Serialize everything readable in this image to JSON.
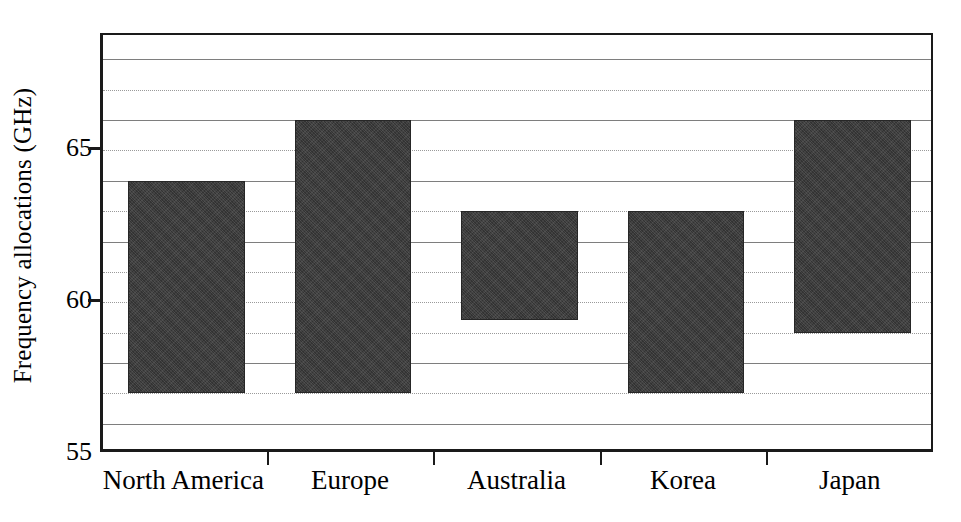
{
  "chart_data": {
    "type": "bar",
    "title": "",
    "subtitle": "",
    "xlabel": "",
    "ylabel": "Frequency allocations (GHz)",
    "categories": [
      "North America",
      "Europe",
      "Australia",
      "Korea",
      "Japan"
    ],
    "bar_style": "floating range bars (band start to band end)",
    "series": [
      {
        "name": "Frequency allocation band",
        "bands": [
          {
            "category": "North America",
            "low": 57.0,
            "high": 64.0
          },
          {
            "category": "Europe",
            "low": 57.0,
            "high": 66.0
          },
          {
            "category": "Australia",
            "low": 59.4,
            "high": 63.0
          },
          {
            "category": "Korea",
            "low": 57.0,
            "high": 63.0
          },
          {
            "category": "Japan",
            "low": 59.0,
            "high": 66.0
          }
        ]
      }
    ],
    "ylim": [
      55.0,
      68.8
    ],
    "xlim": [
      0,
      5
    ],
    "y_tick_labels": [
      "55",
      "60",
      "65"
    ],
    "y_tick_values": [
      55,
      60,
      65
    ],
    "y_minor_gridlines": [
      56,
      57,
      58,
      59,
      61,
      62,
      63,
      64,
      66,
      67,
      68
    ],
    "grid": true,
    "grid_axis": "y",
    "grid_interval": 1,
    "legend": false,
    "legend_position": "none",
    "colors": {
      "bar_fill": "#333333",
      "bar_edge": "#262626",
      "axis": "#1a1a1a",
      "gridline_solid": "#7e7e7e",
      "gridline_dotted": "#9a9a9a",
      "background": "#ffffff",
      "text": "#000000"
    }
  },
  "axes": {
    "y_title": "Frequency allocations (GHz)",
    "y_ticks": [
      {
        "label": "55",
        "value": 55
      },
      {
        "label": "60",
        "value": 60
      },
      {
        "label": "65",
        "value": 65
      }
    ],
    "x_ticks": [
      {
        "label": "North America",
        "value": 0.5
      },
      {
        "label": "Europe",
        "value": 1.5
      },
      {
        "label": "Australia",
        "value": 2.5
      },
      {
        "label": "Korea",
        "value": 3.5
      },
      {
        "label": "Japan",
        "value": 4.5
      }
    ]
  }
}
